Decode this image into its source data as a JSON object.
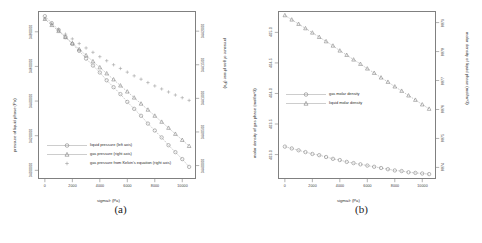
{
  "figure": {
    "background": "#ffffff",
    "axis_color": "#808080",
    "text_color": "#2e2e2e"
  },
  "panels": [
    {
      "id": "a",
      "caption": "(a)",
      "xlabel": "sigma/r (Pa)",
      "ylabel_left": "pressure of liquid phase (Pa)",
      "ylabel_right": "pressure of gas phase (Pa)",
      "legend": [
        {
          "label": "liquid pressure (left axis)",
          "marker": "circle",
          "color": "#8a8a8a"
        },
        {
          "label": "gas pressure (right axis)",
          "marker": "triangle",
          "color": "#8a8a8a"
        },
        {
          "label": "gas pressure from Kelvin's equation (right axis)",
          "marker": "plus",
          "color": "#9a9a9a"
        }
      ],
      "xticks": [
        "0",
        "2000",
        "4000",
        "6000",
        "8000",
        "10000"
      ],
      "yticks_left": [
        "3400000",
        "3420000",
        "3440000",
        "3460000",
        "3480000"
      ],
      "yticks_right": [
        "3440000",
        "3440500",
        "3441000",
        "3441500",
        "3442000"
      ]
    },
    {
      "id": "b",
      "caption": "(b)",
      "xlabel": "sigma/r (Pa)",
      "ylabel_left": "molar density of gas phase (mol/m^3)",
      "ylabel_right": "molar density of liquid phase (mol/m^3)",
      "legend": [
        {
          "label": "gas molar density",
          "marker": "circle",
          "color": "#8a8a8a"
        },
        {
          "label": "liquid molar density",
          "marker": "triangle",
          "color": "#8a8a8a"
        }
      ],
      "xticks": [
        "0",
        "2000",
        "4000",
        "6000",
        "8000",
        "10000"
      ],
      "yticks_left": [
        "403.0",
        "403.5",
        "404.0",
        "404.5",
        "405.0",
        "405.5"
      ],
      "yticks_right": [
        "8874",
        "8875",
        "8876",
        "8877",
        "8878",
        "8879"
      ]
    }
  ],
  "chart_data": [
    {
      "type": "scatter",
      "panel": "a",
      "title": "",
      "xlabel": "sigma/r (Pa)",
      "ylabel": "pressure of liquid phase (Pa)",
      "ylabel_right": "pressure of gas phase (Pa)",
      "xlim": [
        -500,
        11000
      ],
      "ylim_left": [
        3395000,
        3492000
      ],
      "ylim_right": [
        3439800,
        3442300
      ],
      "grid": false,
      "legend_position": "bottom-left",
      "x": [
        0,
        500,
        1000,
        1500,
        2000,
        2500,
        3000,
        3500,
        4000,
        4500,
        5000,
        5500,
        6000,
        6500,
        7000,
        7500,
        8000,
        8500,
        9000,
        9500,
        10000,
        10500
      ],
      "series": [
        {
          "name": "liquid pressure (left axis)",
          "axis": "left",
          "marker": "circle",
          "values": [
            3489000,
            3485000,
            3481000,
            3477000,
            3473000,
            3469000,
            3464500,
            3460500,
            3456500,
            3452000,
            3448000,
            3444000,
            3439500,
            3435500,
            3431500,
            3427000,
            3423000,
            3419000,
            3414500,
            3410500,
            3406500,
            3402000
          ]
        },
        {
          "name": "gas pressure (right axis)",
          "axis": "right",
          "marker": "triangle",
          "values": [
            3442180,
            3442090,
            3442000,
            3441910,
            3441820,
            3441730,
            3441640,
            3441550,
            3441460,
            3441370,
            3441280,
            3441190,
            3441100,
            3441010,
            3440920,
            3440830,
            3440740,
            3440650,
            3440560,
            3440470,
            3440380,
            3440290
          ]
        },
        {
          "name": "gas pressure from Kelvin's equation (right axis)",
          "axis": "right",
          "marker": "plus",
          "values": [
            3442185,
            3442105,
            3442030,
            3441955,
            3441885,
            3441815,
            3441750,
            3441685,
            3441620,
            3441560,
            3441500,
            3441445,
            3441390,
            3441335,
            3441285,
            3441235,
            3441185,
            3441140,
            3441095,
            3441050,
            3441010,
            3440970
          ]
        }
      ]
    },
    {
      "type": "scatter",
      "panel": "b",
      "title": "",
      "xlabel": "sigma/r (Pa)",
      "ylabel": "molar density of gas phase (mol/m^3)",
      "ylabel_right": "molar density of liquid phase (mol/m^3)",
      "xlim": [
        -500,
        11000
      ],
      "ylim_left": [
        402.6,
        405.35
      ],
      "ylim_right": [
        8873.6,
        8879.4
      ],
      "grid": false,
      "legend_position": "middle-left",
      "x": [
        0,
        500,
        1000,
        1500,
        2000,
        2500,
        3000,
        3500,
        4000,
        4500,
        5000,
        5500,
        6000,
        6500,
        7000,
        7500,
        8000,
        8500,
        9000,
        9500,
        10000,
        10500
      ],
      "series": [
        {
          "name": "gas molar density",
          "axis": "left",
          "marker": "circle",
          "values": [
            403.13,
            403.1,
            403.07,
            403.04,
            403.01,
            402.99,
            402.96,
            402.93,
            402.91,
            402.88,
            402.86,
            402.84,
            402.82,
            402.8,
            402.78,
            402.76,
            402.74,
            402.73,
            402.71,
            402.7,
            402.69,
            402.68
          ]
        },
        {
          "name": "liquid molar density",
          "axis": "right",
          "marker": "triangle",
          "values": [
            8879.25,
            8879.1,
            8878.95,
            8878.8,
            8878.65,
            8878.5,
            8878.35,
            8878.2,
            8878.03,
            8877.88,
            8877.72,
            8877.57,
            8877.41,
            8877.26,
            8877.1,
            8876.95,
            8876.79,
            8876.64,
            8876.48,
            8876.33,
            8876.17,
            8876.02
          ]
        }
      ]
    }
  ]
}
